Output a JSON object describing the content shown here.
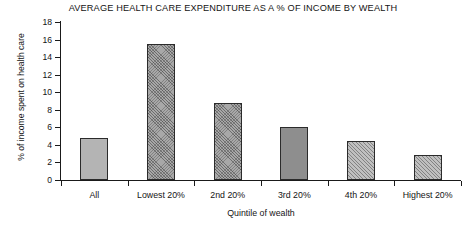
{
  "chart_data": {
    "type": "bar",
    "title": "AVERAGE HEALTH CARE EXPENDITURE AS A % OF INCOME BY WEALTH",
    "xlabel": "Quintile of wealth",
    "ylabel": "% of income spent on health care",
    "categories": [
      "All",
      "Lowest 20%",
      "2nd 20%",
      "3rd 20%",
      "4th 20%",
      "Highest 20%"
    ],
    "values": [
      4.8,
      15.5,
      8.8,
      6.0,
      4.4,
      2.9
    ],
    "ylim": [
      0,
      18
    ],
    "yticks": [
      0,
      2,
      4,
      6,
      8,
      10,
      12,
      14,
      16,
      18
    ],
    "ytick_labels": [
      "0",
      "2",
      "4",
      "6",
      "8",
      "10",
      "12",
      "14",
      "16",
      "18"
    ],
    "grid": false,
    "legend": "none",
    "bar_fills": [
      "solid-light",
      "hatch-dense",
      "hatch-dense",
      "solid-dark",
      "hatch-diag",
      "hatch-diag"
    ],
    "colors": {
      "axis": "#1a1a1a",
      "text": "#141414",
      "bar_light": "#b4b4b4",
      "bar_dark": "#8e8e8e",
      "bar_hatch": "#a8a8a8",
      "background": "#ffffff"
    }
  }
}
